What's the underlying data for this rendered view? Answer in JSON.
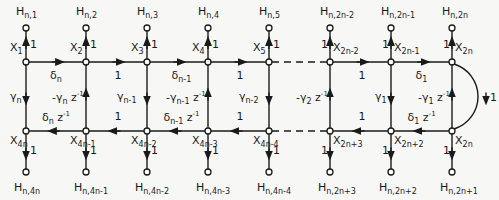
{
  "diagram": {
    "type": "signal-flow-graph",
    "columns_x": [
      26,
      86,
      147,
      208,
      269,
      330,
      391,
      452
    ],
    "rows_y": {
      "h_top": 28,
      "top": 62,
      "bottom": 131,
      "h_bottom": 172
    },
    "top_nodes": [
      {
        "name": "X",
        "sub": "1",
        "h": "n,1"
      },
      {
        "name": "X",
        "sub": "2",
        "h": "n,2"
      },
      {
        "name": "X",
        "sub": "3",
        "h": "n,3"
      },
      {
        "name": "X",
        "sub": "4",
        "h": "n,4"
      },
      {
        "name": "X",
        "sub": "5",
        "h": "n,5"
      },
      {
        "name": "X",
        "sub": "2n-2",
        "h": "n,2n-2"
      },
      {
        "name": "X",
        "sub": "2n-1",
        "h": "n,2n-1"
      },
      {
        "name": "X",
        "sub": "2n",
        "h": "n,2n"
      }
    ],
    "bottom_nodes": [
      {
        "name": "X",
        "sub": "4n",
        "h": "n,4n"
      },
      {
        "name": "X",
        "sub": "4n-1",
        "h": "n,4n-1"
      },
      {
        "name": "X",
        "sub": "4n-2",
        "h": "n,4n-2"
      },
      {
        "name": "X",
        "sub": "4n-3",
        "h": "n,4n-3"
      },
      {
        "name": "X",
        "sub": "4n-4",
        "h": "n,4n-4"
      },
      {
        "name": "X",
        "sub": "2n+3",
        "h": "n,2n+3"
      },
      {
        "name": "X",
        "sub": "2n+2",
        "h": "n,2n+2"
      },
      {
        "name": "X",
        "sub": "2n",
        "h": "n,2n+1"
      }
    ],
    "top_edges": [
      "δn",
      "1",
      "δn-1",
      "1",
      "dashed",
      "1",
      "δ1"
    ],
    "bottom_edges": [
      "δn z⁻¹",
      "1",
      "δn-1 z⁻¹",
      "1",
      "dashed",
      "1",
      "δ1 z⁻¹"
    ],
    "vertical_edges": [
      {
        "dir": "down",
        "label": "γn"
      },
      {
        "dir": "up",
        "label": "-γn z⁻¹"
      },
      {
        "dir": "down",
        "label": "γn-1"
      },
      {
        "dir": "up",
        "label": "-γn-1 z⁻¹"
      },
      {
        "dir": "down",
        "label": "γn-2"
      },
      {
        "dir": "up",
        "label": "-γ2 z⁻¹"
      },
      {
        "dir": "down",
        "label": "γ1"
      },
      {
        "dir": "up",
        "label": "-γ1 z⁻¹"
      }
    ],
    "output_branch_gain": "1",
    "feedback_arc_gain": "1"
  }
}
